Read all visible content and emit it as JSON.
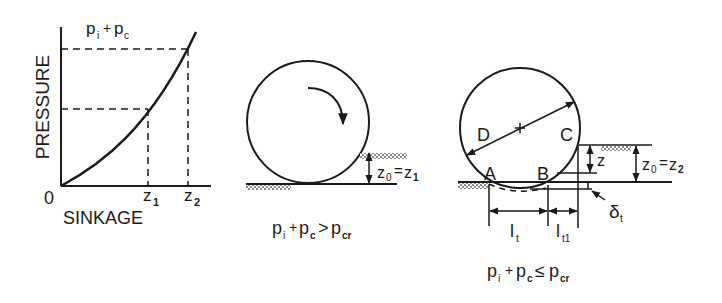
{
  "graph": {
    "y_axis_label": "PRESSURE",
    "x_axis_label": "SINKAGE",
    "origin_label": "0",
    "curve_label_p": "p",
    "curve_label_i": "i",
    "curve_label_plus": "+",
    "curve_label_c": "c",
    "z1_main": "z",
    "z1_sub": "1",
    "z2_main": "z",
    "z2_sub": "2"
  },
  "middle": {
    "sink_main": "z",
    "sink_sub0": "0",
    "sink_eq": "=",
    "sink_rhs": "z",
    "sink_sub1": "1",
    "cond_p1": "p",
    "cond_s1": "i",
    "cond_plus": "+",
    "cond_p2": "p",
    "cond_s2": "c",
    "cond_op": ">",
    "cond_p3": "p",
    "cond_s3": "cr"
  },
  "right": {
    "label_D": "D",
    "label_C": "C",
    "label_A": "A",
    "label_B": "B",
    "label_z": "z",
    "sink_main": "z",
    "sink_sub0": "0",
    "sink_eq": "=",
    "sink_rhs": "z",
    "sink_sub2": "2",
    "delta_main": "δ",
    "delta_sub": "t",
    "lt_main": "l",
    "lt_sub": "t",
    "lt1_main": "l",
    "lt1_sub": "t1",
    "cond_p1": "p",
    "cond_s1": "i",
    "cond_plus": "+",
    "cond_p2": "p",
    "cond_s2": "c",
    "cond_op": "≤",
    "cond_p3": "p",
    "cond_s3": "cr"
  }
}
